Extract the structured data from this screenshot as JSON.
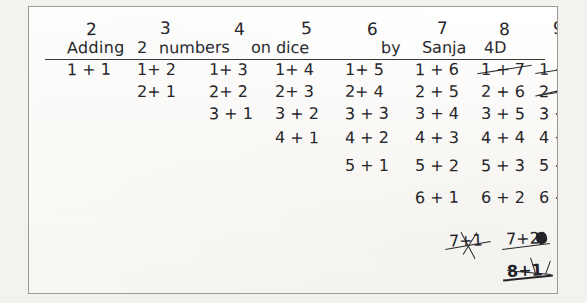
{
  "document": {
    "type": "handwritten-worksheet",
    "title": "Adding 2 numbers on dice",
    "byline": "by Sanja 4D",
    "title_full": "Adding  2 numbers   on dice          by Sanja 4D",
    "ink_color": "#2b2b30",
    "paper_color": "#fdfdfb",
    "background_color": "#f3f2ef"
  },
  "headers": [
    {
      "label": "2",
      "x": 57
    },
    {
      "label": "3",
      "x": 131
    },
    {
      "label": "4",
      "x": 205
    },
    {
      "label": "5",
      "x": 272
    },
    {
      "label": "6",
      "x": 338
    },
    {
      "label": "7",
      "x": 408
    },
    {
      "label": "8",
      "x": 470
    },
    {
      "label": "9",
      "x": 524
    }
  ],
  "title_segments": [
    {
      "text": "Adding",
      "x": 38
    },
    {
      "text": "2",
      "x": 108
    },
    {
      "text": "numbers",
      "x": 130
    },
    {
      "text": "on dice",
      "x": 222
    },
    {
      "text": "by",
      "x": 352
    },
    {
      "text": "Sanja",
      "x": 393
    },
    {
      "text": "4D",
      "x": 455
    }
  ],
  "columns": [
    {
      "sum": "2",
      "x": 38,
      "entries": [
        {
          "text": "1 + 1",
          "row": 0,
          "struck": false
        }
      ]
    },
    {
      "sum": "3",
      "x": 108,
      "entries": [
        {
          "text": "1+ 2",
          "row": 0,
          "struck": false
        },
        {
          "text": "2+ 1",
          "row": 1,
          "struck": false
        }
      ]
    },
    {
      "sum": "4",
      "x": 180,
      "entries": [
        {
          "text": "1+ 3",
          "row": 0,
          "struck": false
        },
        {
          "text": "2+ 2",
          "row": 1,
          "struck": false
        },
        {
          "text": "3 + 1",
          "row": 2,
          "struck": false
        }
      ]
    },
    {
      "sum": "5",
      "x": 246,
      "entries": [
        {
          "text": "1+ 4",
          "row": 0,
          "struck": false
        },
        {
          "text": "2+ 3",
          "row": 1,
          "struck": false
        },
        {
          "text": "3 + 2",
          "row": 2,
          "struck": false
        },
        {
          "text": "4 + 1",
          "row": 3,
          "struck": false
        }
      ]
    },
    {
      "sum": "6",
      "x": 316,
      "entries": [
        {
          "text": "1+ 5",
          "row": 0,
          "struck": false
        },
        {
          "text": "2+ 4",
          "row": 1,
          "struck": false
        },
        {
          "text": "3 + 3",
          "row": 2,
          "struck": false
        },
        {
          "text": "4 + 2",
          "row": 3,
          "struck": false
        },
        {
          "text": "5 + 1",
          "row": 4,
          "struck": false
        }
      ]
    },
    {
      "sum": "7",
      "x": 386,
      "entries": [
        {
          "text": "1 + 6",
          "row": 0,
          "struck": false
        },
        {
          "text": "2 + 5",
          "row": 1,
          "struck": false
        },
        {
          "text": "3 + 4",
          "row": 2,
          "struck": false
        },
        {
          "text": "4 + 3",
          "row": 3,
          "struck": false
        },
        {
          "text": "5 + 2",
          "row": 4,
          "struck": false
        },
        {
          "text": "6 + 1",
          "row": 5,
          "struck": false
        }
      ]
    },
    {
      "sum": "8",
      "x": 452,
      "entries": [
        {
          "text": "1 + 7",
          "row": 0,
          "struck": true
        },
        {
          "text": "2 + 6",
          "row": 1,
          "struck": false
        },
        {
          "text": "3 + 5",
          "row": 2,
          "struck": false
        },
        {
          "text": "4 + 4",
          "row": 3,
          "struck": false
        },
        {
          "text": "5 + 3",
          "row": 4,
          "struck": false
        },
        {
          "text": "6 + 2",
          "row": 5,
          "struck": false
        }
      ]
    },
    {
      "sum": "9",
      "x": 510,
      "entries": [
        {
          "text": "1 + 8",
          "row": 0,
          "struck": true
        },
        {
          "text": "2 + 7",
          "row": 1,
          "struck": true
        },
        {
          "text": "3 + 6",
          "row": 2,
          "struck": false
        },
        {
          "text": "4 + 5",
          "row": 3,
          "struck": false
        },
        {
          "text": "5 + 4",
          "row": 4,
          "struck": false
        },
        {
          "text": "6 + 3",
          "row": 5,
          "struck": false
        }
      ]
    }
  ],
  "crossed_out_notes": [
    {
      "text": "7+1",
      "x": 448,
      "y": 232,
      "note": "crossed out"
    },
    {
      "text": "7+2",
      "x": 505,
      "y": 230,
      "note": "crossed out, last digit overwritten"
    },
    {
      "text": "8+1",
      "x": 506,
      "y": 262,
      "note": "heavily scribbled out"
    }
  ],
  "row_y": [
    55,
    77,
    99,
    123,
    151,
    183
  ]
}
